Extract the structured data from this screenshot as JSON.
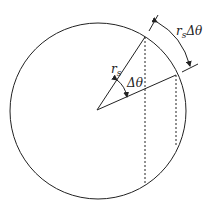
{
  "diagram": {
    "labels": {
      "radius": "r",
      "radius_sub": "s",
      "angle": "Δθ",
      "arc_r": "r",
      "arc_sub": "s",
      "arc_angle": "Δθ"
    },
    "colors": {
      "stroke": "#222222",
      "background": "#ffffff"
    }
  }
}
